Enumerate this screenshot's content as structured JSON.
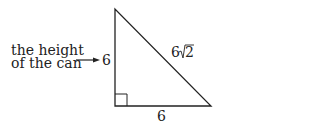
{
  "caption": {
    "line1": "the height",
    "line2": "of the can"
  },
  "labels": {
    "vertical_side": "6",
    "hypotenuse_coef": "6",
    "hypotenuse_radicand": "2",
    "base_side": "6"
  },
  "colors": {
    "stroke": "#222222",
    "background": "#ffffff"
  }
}
